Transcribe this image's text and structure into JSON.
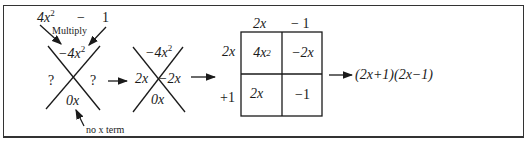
{
  "diagram": {
    "step1": {
      "expression_left": "4x",
      "expression_left_exp": "2",
      "expression_op": "−",
      "expression_right": "1",
      "multiply_label": "Multiply",
      "top": "−4x",
      "top_exp": "2",
      "left": "?",
      "right": "?",
      "bottom": "0x",
      "note": "no x term"
    },
    "step2": {
      "top": "−4x",
      "top_exp": "2",
      "left": "2x",
      "right": "−2x",
      "bottom": "0x"
    },
    "step3_box": {
      "col_headers": [
        "2x",
        "− 1"
      ],
      "row_headers": [
        "2x",
        "+1"
      ],
      "cells": [
        [
          {
            "base": "4x",
            "exp": "2"
          },
          {
            "base": "−2x",
            "exp": ""
          }
        ],
        [
          {
            "base": "2x",
            "exp": ""
          },
          {
            "base": "−1",
            "exp": ""
          }
        ]
      ]
    },
    "result": "(2x+1)(2x−1)"
  }
}
